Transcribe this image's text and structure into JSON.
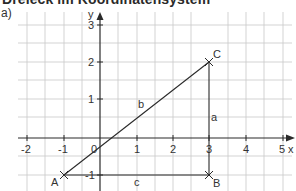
{
  "header": {
    "title": "Dreieck im Koordinatensystem",
    "subtask": "a)"
  },
  "diagram": {
    "type": "coordinate-system",
    "axes": {
      "x_label": "x",
      "y_label": "y",
      "x_ticks": [
        "-2",
        "-1",
        "1",
        "2",
        "3",
        "4",
        "5"
      ],
      "y_ticks": [
        "3",
        "2",
        "1",
        "-1"
      ],
      "origin_label": "0",
      "x_range": [
        -2,
        5
      ],
      "y_range": [
        -1,
        3
      ]
    },
    "points": [
      {
        "name": "A",
        "x": -1,
        "y": -1
      },
      {
        "name": "B",
        "x": 3,
        "y": -1
      },
      {
        "name": "C",
        "x": 3,
        "y": 2
      }
    ],
    "sides": [
      {
        "name": "a",
        "from": "B",
        "to": "C"
      },
      {
        "name": "b",
        "from": "A",
        "to": "C"
      },
      {
        "name": "c",
        "from": "A",
        "to": "B"
      }
    ],
    "colors": {
      "grid": "#c8c8c8",
      "axis": "#2a2a2a",
      "triangle": "#2a2a2a",
      "text": "#333333"
    }
  }
}
